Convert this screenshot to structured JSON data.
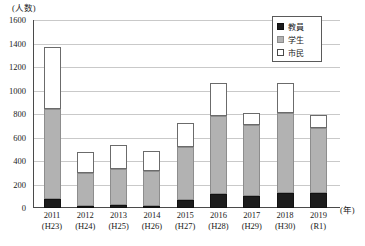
{
  "chart_data": {
    "type": "bar",
    "subtype": "stacked-vertical",
    "title": "",
    "xlabel": "(年)",
    "ylabel": "(人数)",
    "ylim": [
      0,
      1600
    ],
    "yticks": [
      0,
      200,
      400,
      600,
      800,
      1000,
      1200,
      1400,
      1600
    ],
    "grid": true,
    "legend_position": "top-right",
    "categories": [
      "2011",
      "2012",
      "2013",
      "2014",
      "2015",
      "2016",
      "2017",
      "2018",
      "2019"
    ],
    "categories_sub": [
      "(H23)",
      "(H24)",
      "(H25)",
      "(H26)",
      "(H27)",
      "(H28)",
      "(H29)",
      "(H30)",
      "(R1)"
    ],
    "series": [
      {
        "name": "教員",
        "key": "teachers",
        "color": "#1c1c1c",
        "values": [
          78,
          19,
          24,
          17,
          70,
          122,
          103,
          127,
          128
        ]
      },
      {
        "name": "学生",
        "key": "students",
        "color": "#b2b2b2",
        "values": [
          766,
          283,
          309,
          297,
          453,
          662,
          602,
          680,
          554
        ]
      },
      {
        "name": "市民",
        "key": "citizens",
        "color": "#ffffff",
        "values": [
          528,
          177,
          205,
          172,
          198,
          280,
          102,
          255,
          113
        ]
      }
    ],
    "totals": [
      1372,
      479,
      538,
      486,
      721,
      1064,
      807,
      1062,
      795
    ]
  },
  "legend": {
    "items": [
      {
        "label": "教員",
        "swatch": "black-square-icon"
      },
      {
        "label": "学生",
        "swatch": "gray-square-icon"
      },
      {
        "label": "市民",
        "swatch": "white-square-icon"
      }
    ]
  },
  "axes": {
    "y_title": "(人数)",
    "x_title": "(年)",
    "yticks": [
      "1600",
      "1400",
      "1200",
      "1000",
      "800",
      "600",
      "400",
      "200",
      "0"
    ]
  }
}
